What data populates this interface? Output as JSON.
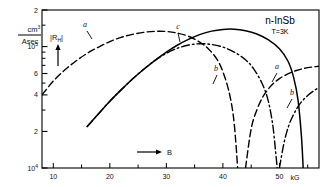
{
  "chart_data": {
    "type": "line",
    "title": "n-InSb",
    "subtitle": "T=3K",
    "xlabel": "B",
    "xunit": "kG",
    "ylabel": "|R_H|",
    "yunit_numerator": "cm",
    "yunit_numerator_exp": "3",
    "yunit_denominator": "Asec",
    "xlim": [
      8,
      57
    ],
    "ylim": [
      10000,
      200000
    ],
    "yscale": "log",
    "xticks": [
      10,
      15,
      20,
      25,
      30,
      35,
      40,
      45,
      50,
      55
    ],
    "xticklabels": [
      "10",
      "",
      "20",
      "",
      "30",
      "",
      "40",
      "",
      "50",
      ""
    ],
    "ytick_major_labels": [
      "10",
      "2",
      "4",
      "6",
      "10",
      "2"
    ],
    "ytick_major_exponents": [
      "4",
      "",
      "",
      "",
      "5",
      ""
    ],
    "ytick_values": [
      10000,
      20000,
      40000,
      60000,
      100000,
      200000
    ],
    "grid": false,
    "legend": "inline-curve-labels",
    "series": [
      {
        "name": "a-left",
        "label": "a",
        "style": "dashed",
        "label_x": 85,
        "label_y": 27,
        "points": [
          [
            8,
            40000
          ],
          [
            10,
            52000
          ],
          [
            12,
            64000
          ],
          [
            14,
            76000
          ],
          [
            16,
            88000
          ],
          [
            18,
            99000
          ],
          [
            20,
            110000
          ],
          [
            22,
            119000
          ],
          [
            24,
            126000
          ],
          [
            26,
            131000
          ],
          [
            28,
            133500
          ],
          [
            30,
            133000
          ],
          [
            32,
            129000
          ],
          [
            34,
            121000
          ],
          [
            36,
            108000
          ],
          [
            37.5,
            95000
          ],
          [
            39,
            78000
          ],
          [
            40,
            62000
          ],
          [
            41,
            44000
          ],
          [
            41.8,
            28000
          ],
          [
            42.3,
            16000
          ],
          [
            42.6,
            10000
          ]
        ]
      },
      {
        "name": "c-left",
        "label": "c",
        "style": "solid",
        "label_x": 178,
        "label_y": 29,
        "points": [
          [
            16,
            22000
          ],
          [
            18,
            28000
          ],
          [
            20,
            35500
          ],
          [
            22,
            44000
          ],
          [
            24,
            54000
          ],
          [
            26,
            65000
          ],
          [
            28,
            77000
          ],
          [
            30,
            90000
          ],
          [
            32,
            103000
          ],
          [
            34,
            115000
          ],
          [
            36,
            126000
          ],
          [
            38,
            134000
          ],
          [
            40,
            138500
          ],
          [
            42,
            139000
          ],
          [
            44,
            135000
          ],
          [
            46,
            127000
          ],
          [
            48,
            114000
          ],
          [
            50,
            96000
          ],
          [
            51.5,
            76000
          ],
          [
            52.5,
            56000
          ],
          [
            53.3,
            36000
          ],
          [
            53.9,
            18000
          ],
          [
            54.2,
            10000
          ]
        ]
      },
      {
        "name": "b-left",
        "label": "b",
        "style": "dashdot",
        "label_x": 216,
        "label_y": 71,
        "points": [
          [
            16,
            22000
          ],
          [
            18,
            28000
          ],
          [
            20,
            35500
          ],
          [
            22,
            44000
          ],
          [
            24,
            54000
          ],
          [
            26,
            65000
          ],
          [
            28,
            77000
          ],
          [
            30,
            88000
          ],
          [
            32,
            97000
          ],
          [
            34,
            103000
          ],
          [
            36,
            105500
          ],
          [
            38,
            104000
          ],
          [
            40,
            99000
          ],
          [
            42,
            90000
          ],
          [
            44,
            78000
          ],
          [
            45.5,
            65000
          ],
          [
            47,
            49000
          ],
          [
            48,
            36000
          ],
          [
            48.8,
            23000
          ],
          [
            49.3,
            14000
          ],
          [
            49.6,
            10000
          ]
        ]
      },
      {
        "name": "a-right",
        "label": "a",
        "style": "dashed",
        "label_x": 277,
        "label_y": 69,
        "points": [
          [
            44,
            10000
          ],
          [
            45,
            21000
          ],
          [
            46,
            30000
          ],
          [
            47,
            38000
          ],
          [
            48,
            44500
          ],
          [
            49,
            50000
          ],
          [
            50,
            54500
          ],
          [
            51,
            58000
          ],
          [
            52,
            61000
          ],
          [
            53,
            63500
          ],
          [
            54,
            65500
          ],
          [
            55,
            67000
          ],
          [
            56,
            68000
          ],
          [
            57,
            68800
          ]
        ]
      },
      {
        "name": "b-right",
        "label": "b",
        "style": "dashdot",
        "label_x": 292,
        "label_y": 95,
        "points": [
          [
            50,
            10000
          ],
          [
            50.8,
            16000
          ],
          [
            51.6,
            22000
          ],
          [
            52.4,
            27000
          ],
          [
            53.2,
            31500
          ],
          [
            54,
            35500
          ],
          [
            55,
            39500
          ],
          [
            56,
            43000
          ],
          [
            57,
            46000
          ]
        ]
      }
    ]
  },
  "annotations": {
    "x_arrow_label": "B",
    "x_unit_label": "kG"
  }
}
